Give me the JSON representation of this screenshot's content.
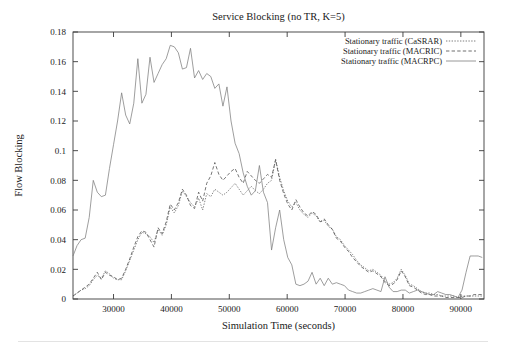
{
  "figure": {
    "width": 506,
    "height": 349,
    "background": "#ffffff"
  },
  "chart_data": {
    "type": "line",
    "title": "Service Blocking (no TR, K=5)",
    "xlabel": "Simulation Time (seconds)",
    "ylabel": "Flow Blocking",
    "grid": false,
    "legend_position": "top-right",
    "xlim": [
      23000,
      94000
    ],
    "ylim": [
      0,
      0.18
    ],
    "xticks": [
      30000,
      40000,
      50000,
      60000,
      70000,
      80000,
      90000
    ],
    "xticklabels": [
      "30000",
      "40000",
      "50000",
      "60000",
      "70000",
      "80000",
      "90000"
    ],
    "yticks": [
      0,
      0.02,
      0.04,
      0.06,
      0.08,
      0.1,
      0.12,
      0.14,
      0.16,
      0.18
    ],
    "yticklabels": [
      "0",
      "0.02",
      "0.04",
      "0.06",
      "0.08",
      "0.1",
      "0.12",
      "0.14",
      "0.16",
      "0.18"
    ],
    "x": [
      23000,
      23700,
      24400,
      25100,
      25800,
      26500,
      27200,
      27900,
      28600,
      29300,
      30000,
      30700,
      31400,
      32100,
      32800,
      33500,
      34200,
      34900,
      35600,
      36300,
      37000,
      37700,
      38400,
      39100,
      39800,
      40500,
      41200,
      41900,
      42600,
      43300,
      44000,
      44700,
      45400,
      46100,
      46800,
      47500,
      48200,
      48900,
      49600,
      50300,
      51000,
      51700,
      52400,
      53100,
      53800,
      54500,
      55200,
      55900,
      56600,
      57300,
      58000,
      58700,
      59400,
      60100,
      60800,
      61500,
      62200,
      62900,
      63600,
      64300,
      65000,
      65700,
      66400,
      67100,
      67800,
      68500,
      69200,
      69900,
      70600,
      71300,
      72000,
      72700,
      73400,
      74100,
      74800,
      75500,
      76200,
      76900,
      77600,
      78300,
      79000,
      79700,
      80400,
      81100,
      81800,
      82500,
      83200,
      83900,
      84600,
      85300,
      86000,
      86700,
      87400,
      88100,
      88800,
      89500,
      90200,
      90900,
      91600,
      92300,
      93000,
      93700
    ],
    "series": [
      {
        "name": "Stationary traffic (CaSRAR)",
        "style": "dotted",
        "color": "#5d5d5d",
        "values": [
          0.002,
          0.004,
          0.006,
          0.007,
          0.009,
          0.013,
          0.016,
          0.014,
          0.019,
          0.017,
          0.014,
          0.013,
          0.013,
          0.019,
          0.026,
          0.033,
          0.04,
          0.045,
          0.044,
          0.042,
          0.038,
          0.047,
          0.043,
          0.05,
          0.062,
          0.058,
          0.063,
          0.073,
          0.069,
          0.065,
          0.062,
          0.068,
          0.06,
          0.071,
          0.069,
          0.074,
          0.072,
          0.07,
          0.072,
          0.075,
          0.078,
          0.074,
          0.07,
          0.073,
          0.076,
          0.073,
          0.071,
          0.074,
          0.078,
          0.08,
          0.094,
          0.082,
          0.073,
          0.066,
          0.062,
          0.065,
          0.06,
          0.057,
          0.055,
          0.058,
          0.056,
          0.052,
          0.053,
          0.049,
          0.047,
          0.042,
          0.04,
          0.036,
          0.033,
          0.03,
          0.026,
          0.023,
          0.021,
          0.019,
          0.02,
          0.018,
          0.016,
          0.012,
          0.01,
          0.011,
          0.014,
          0.02,
          0.016,
          0.01,
          0.009,
          0.007,
          0.005,
          0.004,
          0.004,
          0.003,
          0.003,
          0.002,
          0.002,
          0.002,
          0.002,
          0.001,
          0.002,
          0.002,
          0.002,
          0.002,
          0.002,
          0.002
        ]
      },
      {
        "name": "Stationary traffic (MACRIC)",
        "style": "dashed",
        "color": "#4a4a4a",
        "values": [
          0.002,
          0.004,
          0.006,
          0.008,
          0.01,
          0.014,
          0.018,
          0.013,
          0.018,
          0.016,
          0.015,
          0.013,
          0.014,
          0.02,
          0.027,
          0.035,
          0.042,
          0.046,
          0.045,
          0.04,
          0.035,
          0.048,
          0.044,
          0.052,
          0.064,
          0.06,
          0.065,
          0.074,
          0.07,
          0.063,
          0.061,
          0.072,
          0.066,
          0.078,
          0.083,
          0.092,
          0.084,
          0.08,
          0.083,
          0.086,
          0.088,
          0.082,
          0.078,
          0.086,
          0.083,
          0.08,
          0.078,
          0.081,
          0.084,
          0.082,
          0.094,
          0.08,
          0.071,
          0.064,
          0.06,
          0.067,
          0.062,
          0.058,
          0.056,
          0.059,
          0.057,
          0.052,
          0.054,
          0.05,
          0.047,
          0.041,
          0.039,
          0.035,
          0.032,
          0.028,
          0.025,
          0.022,
          0.02,
          0.018,
          0.019,
          0.017,
          0.015,
          0.011,
          0.009,
          0.01,
          0.013,
          0.019,
          0.015,
          0.009,
          0.008,
          0.006,
          0.004,
          0.003,
          0.003,
          0.002,
          0.002,
          0.002,
          0.001,
          0.001,
          0.001,
          0.001,
          0.001,
          0.002,
          0.002,
          0.003,
          0.003,
          0.003
        ]
      },
      {
        "name": "Stationary traffic (MACRPC)",
        "style": "fine-dotted",
        "color": "#7d7d7d",
        "values": [
          0.029,
          0.036,
          0.04,
          0.041,
          0.055,
          0.08,
          0.072,
          0.069,
          0.07,
          0.088,
          0.104,
          0.12,
          0.139,
          0.124,
          0.118,
          0.132,
          0.162,
          0.132,
          0.138,
          0.163,
          0.146,
          0.152,
          0.158,
          0.162,
          0.171,
          0.17,
          0.166,
          0.155,
          0.156,
          0.169,
          0.149,
          0.154,
          0.148,
          0.152,
          0.15,
          0.142,
          0.145,
          0.13,
          0.143,
          0.12,
          0.105,
          0.098,
          0.085,
          0.076,
          0.07,
          0.073,
          0.09,
          0.072,
          0.065,
          0.033,
          0.048,
          0.06,
          0.04,
          0.028,
          0.023,
          0.01,
          0.009,
          0.01,
          0.012,
          0.018,
          0.01,
          0.014,
          0.009,
          0.014,
          0.01,
          0.011,
          0.01,
          0.009,
          0.006,
          0.005,
          0.004,
          0.004,
          0.005,
          0.006,
          0.007,
          0.006,
          0.005,
          0.015,
          0.008,
          0.005,
          0.005,
          0.006,
          0.006,
          0.004,
          0.005,
          0.006,
          0.005,
          0.004,
          0.003,
          0.003,
          0.005,
          0.004,
          0.003,
          0.003,
          0.002,
          0.001,
          0.006,
          0.018,
          0.029,
          0.029,
          0.029,
          0.028
        ]
      }
    ]
  }
}
